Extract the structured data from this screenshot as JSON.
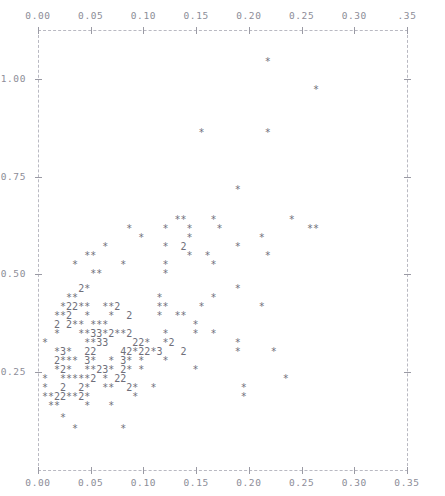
{
  "chart_data": {
    "type": "scatter",
    "title": "",
    "subtitle": "",
    "xlabel": "",
    "ylabel": "",
    "xlim": [
      0.0,
      0.35
    ],
    "ylim": [
      0.0,
      1.125
    ],
    "grid": false,
    "legend": null,
    "marker": "*",
    "overplot_notation": "digits 2/3/4 denote that many coincident points at the same cell",
    "axes": {
      "top": {
        "position": "top",
        "ticks": [
          0.0,
          0.05,
          0.1,
          0.15,
          0.2,
          0.25,
          0.3,
          0.35
        ],
        "ticklabels": [
          "0.00",
          "0.05",
          "0.10",
          "0.15",
          "0.20",
          "0.25",
          "0.30",
          ".35"
        ],
        "style": "dashed"
      },
      "bottom": {
        "position": "bottom",
        "ticks": [
          0.0,
          0.05,
          0.1,
          0.15,
          0.2,
          0.25,
          0.3,
          0.35
        ],
        "ticklabels": [
          "0.00",
          "0.05",
          "0.10",
          "0.15",
          "0.20",
          "0.25",
          "0.30",
          "0.35"
        ],
        "style": "dashed"
      },
      "left": {
        "position": "left",
        "ticks": [
          0.25,
          0.5,
          0.75,
          1.0
        ],
        "ticklabels": [
          "0.25",
          "0.50",
          "0.75",
          "1.00"
        ],
        "style": "dashed"
      },
      "right": {
        "position": "right",
        "ticks": [
          0.25,
          0.5,
          0.75,
          1.0
        ],
        "ticklabels": [],
        "style": "dashed"
      }
    },
    "colors": {
      "background": "#ffffff",
      "axis": "#b9b9c2",
      "tick": "#9a9aa4",
      "tick_label": "#8d8d98",
      "marker": "#6f6f7a"
    },
    "text_rows": [
      {
        "y": 57,
        "x": 36,
        "text": "                                      *"
      },
      {
        "y": 85,
        "x": 36,
        "text": "                                              *"
      },
      {
        "y": 128,
        "x": 36,
        "text": "                           *          *"
      },
      {
        "y": 185,
        "x": 36,
        "text": "                                 *"
      },
      {
        "y": 215,
        "x": 36,
        "text": "                       **    *            *"
      },
      {
        "y": 224,
        "x": 36,
        "text": "               *     *   *    *              **"
      },
      {
        "y": 233,
        "x": 36,
        "text": "                 *       *           *"
      },
      {
        "y": 242,
        "x": 36,
        "text": "           *         *  2        *"
      },
      {
        "y": 251,
        "x": 36,
        "text": "        **               *  *         *"
      },
      {
        "y": 260,
        "x": 36,
        "text": "      *       *      *       *"
      },
      {
        "y": 269,
        "x": 36,
        "text": "         **          *"
      },
      {
        "y": 284,
        "x": 36,
        "text": "       2*                        *"
      },
      {
        "y": 293,
        "x": 36,
        "text": "     **             *        *"
      },
      {
        "y": 302,
        "x": 36,
        "text": "    *22**  **2      **     *         *"
      },
      {
        "y": 311,
        "x": 36,
        "text": "   **2  *   *  2    *  **"
      },
      {
        "y": 320,
        "x": 36,
        "text": "   2 2** ***              *"
      },
      {
        "y": 329,
        "x": 36,
        "text": "   *   **33*2**2     *    *  *"
      },
      {
        "y": 338,
        "x": 36,
        "text": " *      **33    22*  *2          *"
      },
      {
        "y": 347,
        "x": 36,
        "text": "   *3*  22    42*22*3   2        *     *"
      },
      {
        "y": 356,
        "x": 36,
        "text": "   2*** 3*  * 3* *   *"
      },
      {
        "y": 365,
        "x": 36,
        "text": "   *2*  **23* 2* *        *"
      },
      {
        "y": 374,
        "x": 36,
        "text": " *  *****2 * 22                          *"
      },
      {
        "y": 383,
        "x": 36,
        "text": " *  2  2*  **  2*  *              *"
      },
      {
        "y": 392,
        "x": 36,
        "text": " **22**2*       *                 *"
      },
      {
        "y": 401,
        "x": 36,
        "text": "  **    *   *"
      },
      {
        "y": 413,
        "x": 36,
        "text": "    *"
      },
      {
        "y": 424,
        "x": 36,
        "text": "      *       *"
      }
    ],
    "points_note": "Glyph rows transcribed verbatim from the character-cell plot; each '*' is one observation, digits are overplot counts."
  },
  "layout": {
    "plot_left": 38,
    "plot_right": 407,
    "plot_top": 30,
    "plot_bottom": 470,
    "width": 445,
    "height": 496
  }
}
